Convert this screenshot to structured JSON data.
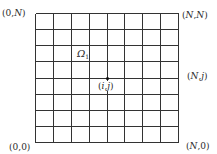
{
  "diagram": {
    "type": "uniform-grid-domain",
    "grid": {
      "columns": 8,
      "rows": 8,
      "left": 35,
      "top": 13,
      "right": 178,
      "bottom": 142,
      "line_color": "#333333",
      "line_width": 1
    },
    "corner_labels": {
      "top_left": {
        "open": "(",
        "a": "0",
        "sep": ",",
        "b": "N",
        "close": ")"
      },
      "top_right": {
        "open": "(",
        "a": "N",
        "sep": ",",
        "b": "N",
        "close": ")"
      },
      "bottom_left": {
        "open": "(",
        "a": "0",
        "sep": ",",
        "b": "0",
        "close": ")"
      },
      "bottom_right": {
        "open": "(",
        "a": "N",
        "sep": ",",
        "b": "0",
        "close": ")"
      }
    },
    "side_label": {
      "open": "(",
      "a": "N",
      "sep": ",",
      "b": "j",
      "close": ")"
    },
    "region_label": {
      "symbol": "Ω",
      "subscript": "1"
    },
    "node": {
      "label_open": "(",
      "label_a": "i",
      "label_sep": ",",
      "label_b": "j",
      "label_close": ")",
      "column_index": 4,
      "row_index_from_top": 4,
      "color": "#111111"
    }
  }
}
